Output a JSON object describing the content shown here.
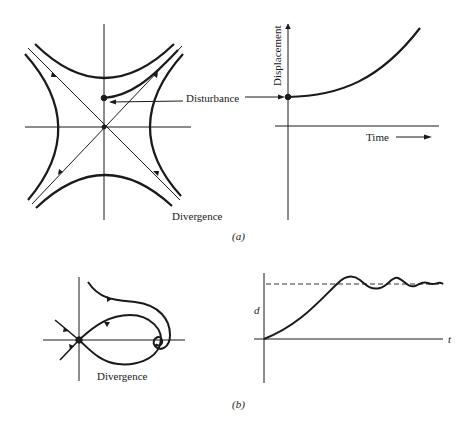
{
  "figure": {
    "panel_a": {
      "caption": "(a)",
      "phase_plot": {
        "disturbance_label": "Disturbance",
        "divergence_label": "Divergence"
      },
      "time_plot": {
        "ylabel": "Displacement",
        "xlabel": "Time"
      }
    },
    "panel_b": {
      "caption": "(b)",
      "phase_plot": {
        "divergence_label": "Divergence"
      },
      "time_plot": {
        "ylabel": "d",
        "xlabel": "t"
      }
    }
  },
  "colors": {
    "ink": "#1a1a1a",
    "background": "#ffffff"
  }
}
